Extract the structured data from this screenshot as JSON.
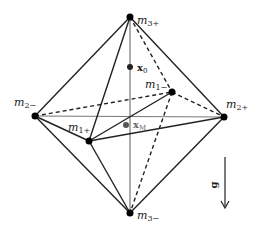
{
  "diagram": {
    "type": "octahedron",
    "vertices": [
      {
        "id": "m3p",
        "label": "m",
        "sub": "3+",
        "x": 130,
        "y": 17
      },
      {
        "id": "m3m",
        "label": "m",
        "sub": "3−",
        "x": 130,
        "y": 213
      },
      {
        "id": "m2m",
        "label": "m",
        "sub": "2−",
        "x": 35,
        "y": 116
      },
      {
        "id": "m2p",
        "label": "m",
        "sub": "2+",
        "x": 224,
        "y": 117
      },
      {
        "id": "m1m",
        "label": "m",
        "sub": "1−",
        "x": 172,
        "y": 92
      },
      {
        "id": "m1p",
        "label": "m",
        "sub": "1+",
        "x": 89,
        "y": 141
      }
    ],
    "points": [
      {
        "id": "x0",
        "label": "x",
        "sub": "0",
        "x": 130,
        "y": 67
      },
      {
        "id": "xM",
        "label": "x",
        "sub": "M",
        "x": 126,
        "y": 125
      }
    ],
    "gravity": {
      "label": "g",
      "direction": "down"
    },
    "colors": {
      "edge": "#222222",
      "axis": "#777777",
      "vertex": "#000000"
    }
  }
}
